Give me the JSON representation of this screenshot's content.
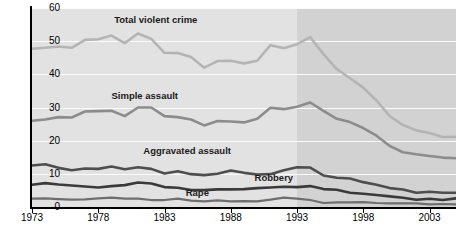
{
  "chart_data": {
    "type": "line",
    "title": "",
    "subtitle": "",
    "xlabel": "",
    "ylabel": "",
    "xlim": [
      1973,
      2005
    ],
    "ylim": [
      0,
      60
    ],
    "grid": true,
    "legend_position": "inline-labels",
    "y_ticks": [
      "0",
      "10",
      "20",
      "30",
      "40",
      "50",
      "60"
    ],
    "y_tick_values": [
      0,
      10,
      20,
      30,
      40,
      50,
      60
    ],
    "x_ticks": [
      "1973",
      "1978",
      "1983",
      "1988",
      "1993",
      "1998",
      "2003"
    ],
    "x_tick_values": [
      1973,
      1978,
      1983,
      1988,
      1993,
      1998,
      2003
    ],
    "x": [
      1973,
      1974,
      1975,
      1976,
      1977,
      1978,
      1979,
      1980,
      1981,
      1982,
      1983,
      1984,
      1985,
      1986,
      1987,
      1988,
      1989,
      1990,
      1991,
      1992,
      1993,
      1994,
      1995,
      1996,
      1997,
      1998,
      1999,
      2000,
      2001,
      2002,
      2003,
      2004,
      2005
    ],
    "shaded_region": {
      "from": 1993,
      "to": 2005,
      "color": "#d2d2d2"
    },
    "plot_background": "#e2e2e2",
    "gridline_color": "#fbfbfb",
    "series": [
      {
        "name": "Total violent crime",
        "color": "#b4b4b4",
        "width": 2.6,
        "label_x": 1979.2,
        "label_y": 56.5,
        "values": [
          47.7,
          48.0,
          48.4,
          48.0,
          50.4,
          50.6,
          51.7,
          49.4,
          52.3,
          50.7,
          46.5,
          46.4,
          45.2,
          42.0,
          44.0,
          44.1,
          43.3,
          44.1,
          48.8,
          47.9,
          49.1,
          51.2,
          46.1,
          41.6,
          38.8,
          36.0,
          32.1,
          27.4,
          24.7,
          23.1,
          22.3,
          21.1,
          21.2
        ]
      },
      {
        "name": "Simple assault",
        "color": "#8c8c8c",
        "width": 2.6,
        "label_x": 1979.0,
        "label_y": 33.5,
        "values": [
          26.0,
          26.4,
          27.1,
          27.0,
          28.8,
          28.9,
          29.0,
          27.4,
          30.0,
          30.0,
          27.4,
          27.1,
          26.4,
          24.6,
          25.9,
          25.8,
          25.5,
          26.6,
          29.9,
          29.5,
          30.2,
          31.5,
          29.0,
          26.6,
          25.6,
          23.8,
          21.5,
          18.4,
          16.5,
          15.9,
          15.4,
          14.9,
          14.7
        ]
      },
      {
        "name": "Aggravated assault",
        "color": "#4e4e4e",
        "width": 2.6,
        "label_x": 1981.4,
        "label_y": 17.0,
        "values": [
          12.5,
          12.9,
          11.8,
          11.1,
          11.6,
          11.5,
          12.2,
          11.4,
          12.0,
          11.5,
          10.1,
          10.8,
          9.9,
          9.6,
          10.0,
          11.0,
          10.3,
          9.8,
          9.9,
          11.1,
          12.0,
          11.9,
          9.5,
          8.8,
          8.6,
          7.5,
          6.7,
          5.7,
          5.3,
          4.3,
          4.6,
          4.3,
          4.3
        ]
      },
      {
        "name": "Robbery",
        "color": "#3a3a3a",
        "width": 2.6,
        "label_x": 1989.8,
        "label_y": 8.6,
        "values": [
          6.7,
          7.2,
          6.8,
          6.5,
          6.2,
          5.9,
          6.3,
          6.6,
          7.4,
          7.1,
          6.0,
          5.8,
          5.1,
          5.1,
          5.3,
          5.3,
          5.4,
          5.7,
          5.9,
          6.1,
          6.0,
          6.3,
          5.4,
          5.2,
          4.3,
          4.0,
          3.6,
          3.2,
          2.8,
          2.2,
          2.5,
          2.1,
          2.6
        ]
      },
      {
        "name": "Rape",
        "color": "#6e6e6e",
        "width": 2.2,
        "label_x": 1984.6,
        "label_y": 4.2,
        "values": [
          2.5,
          2.6,
          2.4,
          2.2,
          2.3,
          2.6,
          2.8,
          2.5,
          2.5,
          2.1,
          2.1,
          2.5,
          1.9,
          1.7,
          2.0,
          1.7,
          1.8,
          1.7,
          2.2,
          2.8,
          2.5,
          2.1,
          1.2,
          1.4,
          1.4,
          1.5,
          1.2,
          1.1,
          1.1,
          1.1,
          0.8,
          0.9,
          0.8
        ]
      }
    ]
  }
}
